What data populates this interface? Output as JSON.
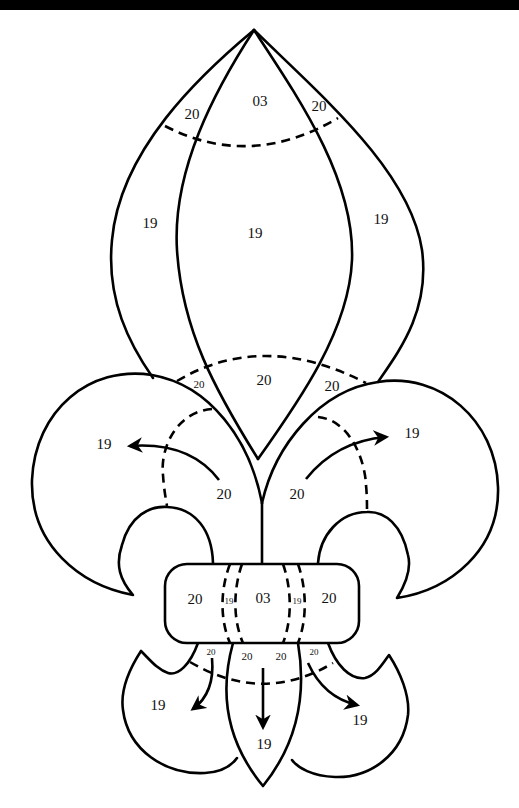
{
  "diagram": {
    "colors": {
      "line": "#000000",
      "background": "#ffffff",
      "top_bar": "#000000"
    },
    "top_section": {
      "labels": {
        "tip_left": "20",
        "tip_center": "03",
        "tip_right": "20",
        "outer_left": "19",
        "center": "19",
        "outer_right": "19"
      }
    },
    "middle_section": {
      "labels": {
        "arc_left": "20",
        "arc_center": "20",
        "arc_right": "20",
        "left_petal": "19",
        "left_petal_inner": "20",
        "right_petal": "19",
        "right_petal_inner": "20"
      }
    },
    "band": {
      "labels": {
        "left": "20",
        "left_stripe": "19",
        "center": "03",
        "right_stripe": "19",
        "right": "20"
      }
    },
    "bottom_section": {
      "labels": {
        "under_band_far_left": "20",
        "under_band_left": "20",
        "under_band_right": "20",
        "under_band_far_right": "20",
        "left_lobe": "19",
        "center_lobe": "19",
        "right_lobe": "19"
      }
    }
  }
}
